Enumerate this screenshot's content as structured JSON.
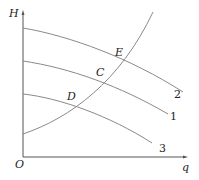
{
  "diagram": {
    "title": "",
    "axes": {
      "y_label": "H",
      "x_label": "q",
      "origin_label": "O"
    },
    "curves": [
      {
        "id": "pump-curve-2",
        "label": "2",
        "path": "M23,28 C70,36 130,58 183,92"
      },
      {
        "id": "pump-curve-1",
        "label": "1",
        "path": "M23,61 C70,68 120,86 168,114"
      },
      {
        "id": "pump-curve-3",
        "label": "3",
        "path": "M23,94 C60,98 110,116 152,143"
      },
      {
        "id": "system-curve",
        "label": "",
        "path": "M23,134 C70,118 120,82 153,12"
      }
    ],
    "points": [
      {
        "id": "E",
        "label": "E",
        "x": 119,
        "y": 62
      },
      {
        "id": "C",
        "label": "C",
        "x": 100,
        "y": 81
      },
      {
        "id": "D",
        "label": "D",
        "x": 72,
        "y": 105
      }
    ],
    "colors": {
      "line": "#8a8a8a",
      "axis": "#555555",
      "text": "#222222"
    }
  }
}
